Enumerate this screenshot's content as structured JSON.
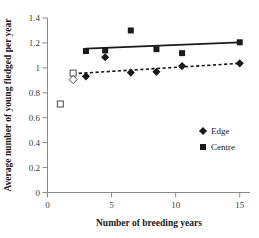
{
  "chart_data": {
    "type": "scatter",
    "title": "",
    "xlabel": "Number of breeding years",
    "ylabel": "Average number of young fledged per year",
    "xlim": [
      0,
      15.8
    ],
    "ylim": [
      0,
      1.4
    ],
    "xticks": [
      0,
      5,
      10,
      15
    ],
    "xticklabels": [
      "0",
      "5",
      "10",
      "15"
    ],
    "yticks": [
      0,
      0.2,
      0.4,
      0.6,
      0.8,
      1,
      1.2,
      1.4
    ],
    "yticklabels": [
      "0",
      "0.2",
      "0.4",
      "0.6",
      "0.8",
      "1",
      "1.2",
      "1.4"
    ],
    "grid": false,
    "legend_position": "lower-right",
    "series": [
      {
        "name": "Edge",
        "marker": "filled-diamond",
        "color": "#1a1a1a",
        "points": [
          {
            "x": 3.0,
            "y": 0.932
          },
          {
            "x": 4.5,
            "y": 1.085
          },
          {
            "x": 6.5,
            "y": 0.962
          },
          {
            "x": 8.5,
            "y": 0.968
          },
          {
            "x": 10.5,
            "y": 1.014
          },
          {
            "x": 15.0,
            "y": 1.036
          }
        ]
      },
      {
        "name": "Centre",
        "marker": "filled-square",
        "color": "#1a1a1a",
        "points": [
          {
            "x": 3.0,
            "y": 1.135
          },
          {
            "x": 4.5,
            "y": 1.14
          },
          {
            "x": 6.5,
            "y": 1.3
          },
          {
            "x": 8.5,
            "y": 1.15
          },
          {
            "x": 10.5,
            "y": 1.118
          },
          {
            "x": 15.0,
            "y": 1.205
          }
        ]
      },
      {
        "name": "Open squares",
        "marker": "open-square",
        "color": "#4a4a4a",
        "points": [
          {
            "x": 1.0,
            "y": 0.71
          },
          {
            "x": 2.0,
            "y": 0.958
          }
        ]
      },
      {
        "name": "Open diamond",
        "marker": "open-diamond",
        "color": "#4a4a4a",
        "points": [
          {
            "x": 2.0,
            "y": 0.906
          }
        ]
      }
    ],
    "trendlines": [
      {
        "name": "Centre trend",
        "style": "solid",
        "x0": 3.0,
        "y0": 1.155,
        "x1": 15.0,
        "y1": 1.205
      },
      {
        "name": "Edge trend",
        "style": "dashed",
        "x0": 2.0,
        "y0": 0.953,
        "x1": 15.0,
        "y1": 1.036
      }
    ],
    "legend": [
      {
        "label": "Edge",
        "marker": "filled-diamond"
      },
      {
        "label": "Centre",
        "marker": "filled-square"
      }
    ]
  }
}
